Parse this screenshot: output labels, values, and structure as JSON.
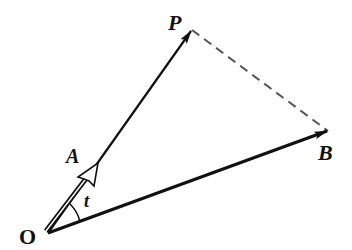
{
  "diagram": {
    "type": "vector-diagram",
    "points": {
      "O": {
        "label": "O",
        "x": 48,
        "y": 233
      },
      "A": {
        "label": "A",
        "x": 98,
        "y": 163
      },
      "P": {
        "label": "P",
        "x": 192,
        "y": 30
      },
      "B": {
        "label": "B",
        "x": 328,
        "y": 131
      }
    },
    "vectors": [
      {
        "from": "O",
        "to": "P",
        "style": "solid",
        "arrow": "filled"
      },
      {
        "from": "O",
        "to": "B",
        "style": "solid-thick",
        "arrow": "filled"
      },
      {
        "from": "O",
        "to": "A",
        "style": "double-line",
        "arrow": "hollow"
      }
    ],
    "segments": [
      {
        "from": "P",
        "to": "B",
        "style": "dashed"
      }
    ],
    "angle": {
      "vertex": "O",
      "between": [
        "A",
        "B"
      ],
      "label": "t"
    },
    "labels": {
      "O": "O",
      "A": "A",
      "P": "P",
      "B": "B",
      "t": "t"
    },
    "colors": {
      "stroke": "#111111",
      "dashed": "#555555",
      "background": "#ffffff"
    }
  }
}
